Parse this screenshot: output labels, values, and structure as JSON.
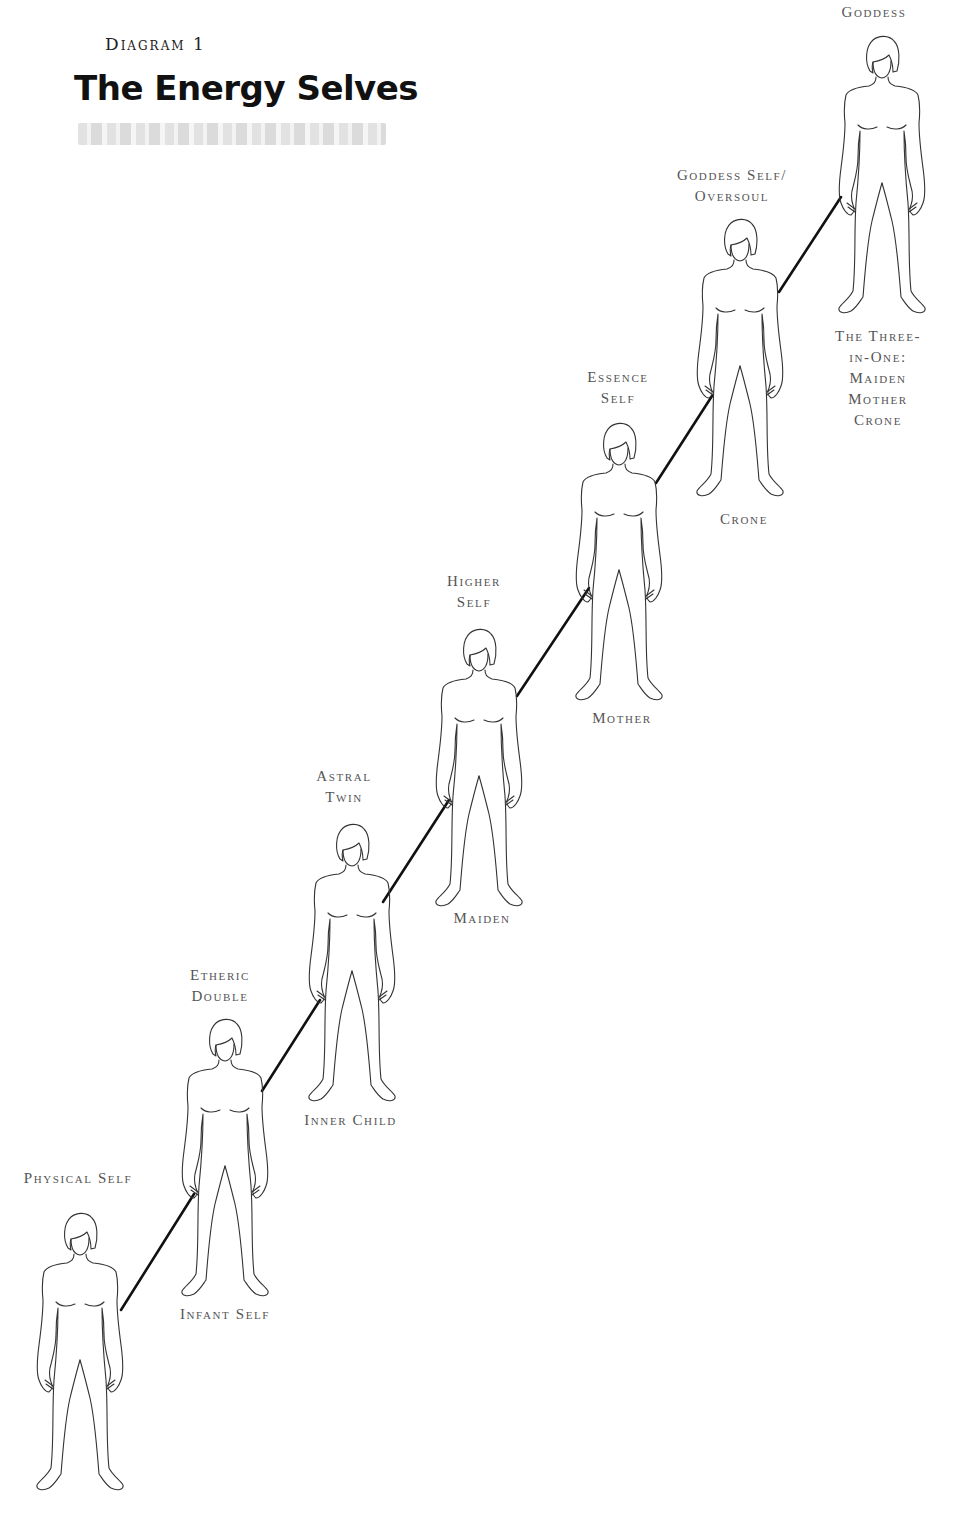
{
  "header": {
    "diagram_number": "Diagram 1",
    "title": "The Energy Selves"
  },
  "figures": [
    {
      "name": "physical-self",
      "top_label": [
        "Physical Self"
      ],
      "bottom_label": [],
      "x": 25,
      "y": 1210
    },
    {
      "name": "etheric-double",
      "top_label": [
        "Etheric",
        "Double"
      ],
      "bottom_label": [
        "Infant Self"
      ],
      "x": 170,
      "y": 1016
    },
    {
      "name": "astral-twin",
      "top_label": [
        "Astral",
        "Twin"
      ],
      "bottom_label": [
        "Inner Child"
      ],
      "x": 297,
      "y": 821
    },
    {
      "name": "higher-self",
      "top_label": [
        "Higher",
        "Self"
      ],
      "bottom_label": [
        "Maiden"
      ],
      "x": 424,
      "y": 626
    },
    {
      "name": "essence-self",
      "top_label": [
        "Essence",
        "Self"
      ],
      "bottom_label": [
        "Mother"
      ],
      "x": 564,
      "y": 420
    },
    {
      "name": "goddess-self-oversoul",
      "top_label": [
        "Goddess Self/",
        "Oversoul"
      ],
      "bottom_label": [
        "Crone"
      ],
      "x": 685,
      "y": 216
    },
    {
      "name": "goddess",
      "top_label": [
        "Goddess"
      ],
      "bottom_label": [
        "The Three-",
        "in-One:",
        "Maiden",
        "Mother",
        "Crone"
      ],
      "x": 827,
      "y": 33
    }
  ],
  "labels": {
    "physical_self": "Physical Self",
    "etheric_1": "Etheric",
    "etheric_2": "Double",
    "infant_self": "Infant Self",
    "astral_1": "Astral",
    "astral_2": "Twin",
    "inner_child": "Inner Child",
    "higher_1": "Higher",
    "higher_2": "Self",
    "maiden": "Maiden",
    "essence_1": "Essence",
    "essence_2": "Self",
    "mother": "Mother",
    "goddess_self_1": "Goddess Self/",
    "goddess_self_2": "Oversoul",
    "crone": "Crone",
    "goddess": "Goddess",
    "three_in_one_1": "The Three-",
    "three_in_one_2": "in-One:",
    "three_in_one_3": "Maiden",
    "three_in_one_4": "Mother",
    "three_in_one_5": "Crone"
  },
  "colors": {
    "line": "#111111",
    "outline": "#333333",
    "label": "#555555",
    "background": "#ffffff"
  }
}
